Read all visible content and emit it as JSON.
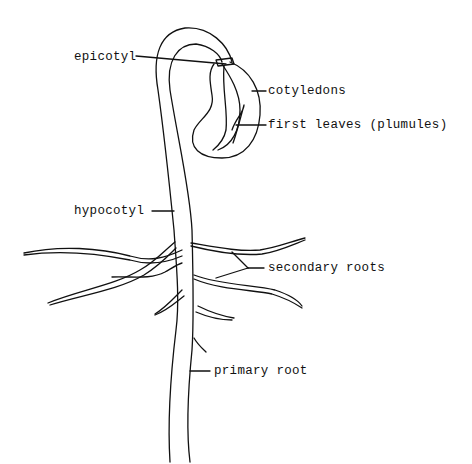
{
  "diagram": {
    "labels": {
      "epicotyl": "epicotyl",
      "cotyledons": "cotyledons",
      "first_leaves": "first leaves (plumules)",
      "hypocotyl": "hypocotyl",
      "secondary_roots": "secondary roots",
      "primary_root": "primary root"
    },
    "colors": {
      "line": "#111111",
      "background": "#ffffff"
    }
  }
}
